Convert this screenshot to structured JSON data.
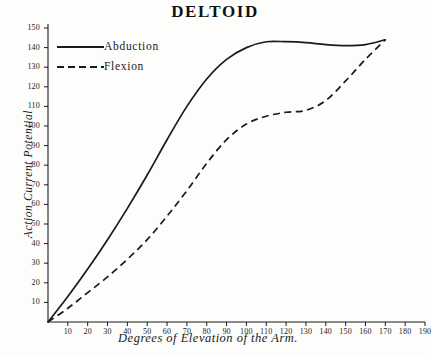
{
  "chart_data": {
    "type": "line",
    "title": "DELTOID",
    "xlabel": "Degrees of Elevation of the Arm.",
    "ylabel": "Action Current Potential",
    "xlim": [
      0,
      190
    ],
    "ylim": [
      0,
      150
    ],
    "grid": false,
    "legend_position": "top-left",
    "xticks": [
      10,
      20,
      30,
      40,
      50,
      60,
      70,
      80,
      90,
      100,
      110,
      120,
      130,
      140,
      150,
      160,
      170,
      180,
      190
    ],
    "yticks": [
      10,
      20,
      30,
      40,
      50,
      60,
      70,
      80,
      90,
      100,
      110,
      120,
      130,
      140,
      150
    ],
    "series": [
      {
        "name": "Abduction",
        "style": "solid",
        "color": "#1a1a1a",
        "x": [
          0,
          10,
          20,
          30,
          40,
          50,
          60,
          70,
          80,
          90,
          100,
          110,
          120,
          130,
          140,
          150,
          160,
          170
        ],
        "values": [
          0,
          13,
          27,
          42,
          58,
          75,
          93,
          110,
          124,
          134,
          140,
          143,
          143,
          142.5,
          141.5,
          141,
          141.5,
          144
        ]
      },
      {
        "name": "Flexion",
        "style": "dashed",
        "color": "#1a1a1a",
        "x": [
          0,
          10,
          20,
          30,
          40,
          50,
          60,
          70,
          80,
          90,
          100,
          110,
          120,
          130,
          140,
          150,
          160,
          170
        ],
        "values": [
          0,
          7,
          15,
          23,
          32,
          42,
          54,
          67,
          81,
          93,
          101,
          105,
          107,
          108,
          113,
          123,
          134,
          144
        ]
      }
    ]
  },
  "legend": {
    "items": [
      {
        "label": "Abduction",
        "style": "solid"
      },
      {
        "label": "Flexion",
        "style": "dashed"
      }
    ]
  }
}
